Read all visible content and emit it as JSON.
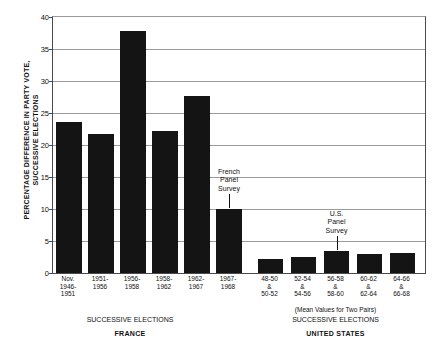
{
  "chart_data": {
    "type": "bar",
    "title": "",
    "subtitle": "",
    "xlabel": "SUCCESSIVE ELECTIONS",
    "ylabel": "PERCENTAGE DIFFERENCE IN PARTY VOTE,\nSUCCESSIVE ELECTIONS",
    "ylim": [
      0,
      40
    ],
    "ytick_values": [
      0,
      5,
      10,
      15,
      20,
      25,
      30,
      35,
      40
    ],
    "ytick_labels": [
      "0",
      "5",
      "10",
      "15",
      "20",
      "25",
      "30",
      "35",
      "40"
    ],
    "grid": true,
    "legend_position": "none",
    "bar_color": "#141414",
    "groups": [
      {
        "name": "FRANCE",
        "axis_caption": "SUCCESSIVE ELECTIONS",
        "note": "",
        "categories": [
          "Nov.\n1946-\n1951",
          "1951-\n1956",
          "1956-\n1958",
          "1958-\n1962",
          "1962-\n1967",
          "1967-\n1968"
        ],
        "values": [
          23.6,
          21.7,
          37.8,
          22.2,
          27.7,
          10.0
        ]
      },
      {
        "name": "UNITED STATES",
        "axis_caption": "SUCCESSIVE ELECTIONS",
        "note": "(Mean Values for Two Pairs)",
        "categories": [
          "48-50\n&\n50-52",
          "52-54\n&\n54-56",
          "56-58\n&\n58-60",
          "60-62\n&\n62-64",
          "64-66\n&\n66-68"
        ],
        "values": [
          2.2,
          2.5,
          3.4,
          3.0,
          3.1
        ]
      }
    ],
    "annotations": [
      {
        "text": "French\nPanel\nSurvey",
        "target_group": 0,
        "target_index": 5
      },
      {
        "text": "U.S.\nPanel\nSurvey",
        "target_group": 1,
        "target_index": 2
      }
    ]
  }
}
